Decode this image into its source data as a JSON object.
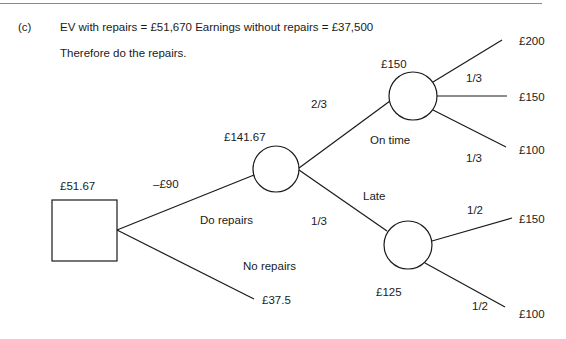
{
  "header": {
    "part_label": "(c)",
    "ev_statement": "EV with repairs = £51,670 Earnings without repairs = £37,500",
    "conclusion": "Therefore do the repairs."
  },
  "tree": {
    "decision_node": {
      "value": "£51.67"
    },
    "branches": {
      "do_repairs": {
        "label": "Do repairs",
        "cost": "–£90"
      },
      "no_repairs": {
        "label": "No repairs",
        "payoff": "£37.5"
      }
    },
    "chance_node_main": {
      "value": "£141.67",
      "on_time": {
        "label": "On time",
        "probability": "2/3"
      },
      "late": {
        "label": "Late",
        "probability": "1/3"
      }
    },
    "chance_node_on_time": {
      "value": "£150",
      "outcomes": [
        {
          "payoff": "£200"
        },
        {
          "payoff": "£150",
          "probability": "1/3"
        },
        {
          "payoff": "£100",
          "probability": "1/3"
        }
      ]
    },
    "chance_node_late": {
      "value": "£125",
      "outcomes": [
        {
          "payoff": "£150",
          "probability": "1/2"
        },
        {
          "payoff": "£100",
          "probability": "1/2"
        }
      ]
    }
  }
}
